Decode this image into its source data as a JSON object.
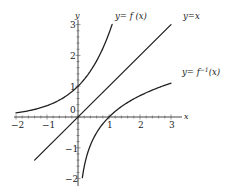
{
  "chart_data": {
    "type": "line",
    "title": "",
    "xlabel": "x",
    "ylabel": "y",
    "xlim": [
      -2,
      3
    ],
    "ylim": [
      -2,
      3
    ],
    "grid": false,
    "x_ticks": [
      -2,
      -1,
      1,
      2,
      3
    ],
    "y_ticks": [
      -2,
      -1,
      1,
      2,
      3
    ],
    "origin_label": "0",
    "series": [
      {
        "name": "y=f(x)",
        "function": "e^x",
        "x": [
          -2,
          -1.5,
          -1,
          -0.5,
          0,
          0.5,
          0.8,
          1.0,
          1.1
        ],
        "y": [
          0.14,
          0.22,
          0.37,
          0.61,
          1.0,
          1.65,
          2.23,
          2.72,
          3.0
        ]
      },
      {
        "name": "y=x",
        "function": "x",
        "x": [
          -1.4,
          3
        ],
        "y": [
          -1.4,
          3
        ]
      },
      {
        "name": "y=f^-1(x)",
        "function": "ln x",
        "x": [
          0.14,
          0.22,
          0.37,
          0.61,
          1.0,
          1.65,
          2.23,
          2.72,
          3.0
        ],
        "y": [
          -2,
          -1.5,
          -1,
          -0.5,
          0,
          0.5,
          0.8,
          1.0,
          1.1
        ]
      }
    ],
    "annotations": [
      {
        "text": "y=f(x)",
        "near": "top of exponential curve"
      },
      {
        "text": "y=x",
        "near": "top-right end of line"
      },
      {
        "text": "y=f⁻¹(x)",
        "near": "right end of logarithmic curve"
      }
    ]
  },
  "labels": {
    "y_axis": "y",
    "x_axis": "x",
    "origin": "0",
    "x_ticks": [
      "−2",
      "−1",
      "1",
      "2",
      "3"
    ],
    "y_ticks": [
      "3",
      "2",
      "1",
      "−1",
      "−2"
    ],
    "curve_f": "y= f (x)",
    "curve_identity": "y=x",
    "curve_finv_main": "y= f",
    "curve_finv_sup": "−1",
    "curve_finv_arg": "(x)"
  }
}
